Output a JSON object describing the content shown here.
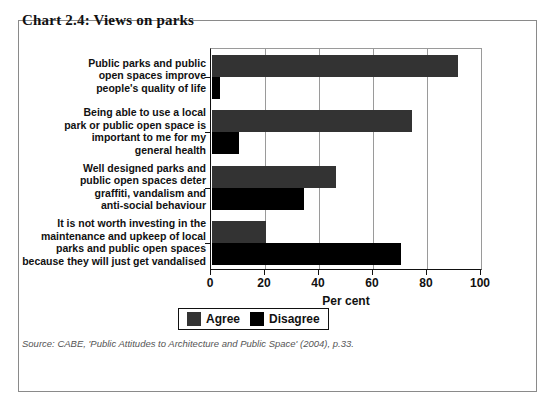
{
  "chart_title": "Chart 2.4: Views on parks",
  "source_note": "Source: CABE, 'Public Attitudes to Architecture and Public Space' (2004), p.33.",
  "legend": {
    "entries": [
      {
        "label": "Agree",
        "color": "#333333"
      },
      {
        "label": "Disagree",
        "color": "#000000"
      }
    ]
  },
  "chart_data": {
    "type": "bar",
    "orientation": "horizontal",
    "title": "Chart 2.4: Views on parks",
    "xlabel": "Per cent",
    "ylabel": "",
    "xlim": [
      0,
      100
    ],
    "xticks": [
      0,
      20,
      40,
      60,
      80,
      100
    ],
    "xticklabels": [
      "0",
      "20",
      "40",
      "60",
      "80",
      "100"
    ],
    "grid": true,
    "legend_position": "bottom",
    "categories": [
      "Public parks and public open spaces improve people's quality of life",
      "Being able to use a local park or public open space is important to me for my general health",
      "Well designed parks and public open spaces deter graffiti, vandalism and anti-social behaviour",
      "It is not worth investing in the maintenance and upkeep of local parks and public open spaces because they will just get vandalised"
    ],
    "category_lines": [
      [
        "Public parks and public",
        "open spaces improve",
        "people's quality of life"
      ],
      [
        "Being able to use a local",
        "park or public open space is",
        "important to me for my",
        "general health"
      ],
      [
        "Well designed parks and",
        "public open spaces deter",
        "graffiti, vandalism and",
        "anti-social behaviour"
      ],
      [
        "It is not worth investing in the",
        "maintenance and upkeep of local",
        "parks and public open spaces",
        "because they will just get vandalised"
      ]
    ],
    "series": [
      {
        "name": "Agree",
        "color": "#333333",
        "values": [
          91,
          74,
          46,
          20
        ]
      },
      {
        "name": "Disagree",
        "color": "#000000",
        "values": [
          3,
          10,
          34,
          70
        ]
      }
    ]
  }
}
